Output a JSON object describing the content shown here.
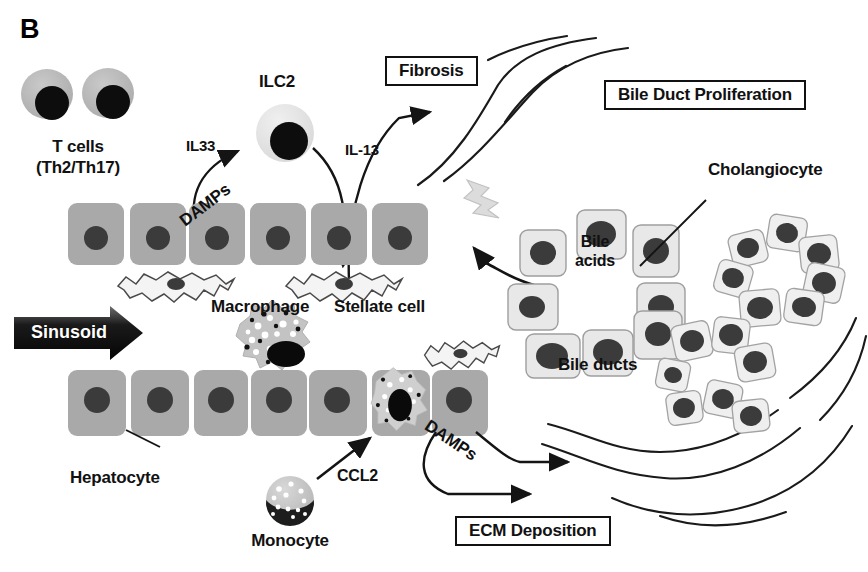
{
  "figure": {
    "panel_letter": "B",
    "background_color": "#ffffff"
  },
  "palette": {
    "hepatocyte_fill": "#a9a9a9",
    "hepatocyte_stroke": "#8c8c8c",
    "nucleus_dark": "#3b3b3b",
    "nucleus_black": "#0d0d0d",
    "tcell_fill": "#b9b9b9",
    "ilc2_fill": "#e2e2e2",
    "cholangiocyte_fill": "#e8e8e8",
    "cholangiocyte_stroke": "#9a9a9a",
    "stellate_fill": "#f2f2f2",
    "stellate_stroke": "#5a5a5a",
    "macrophage_fill": "#c3c3c3",
    "monocyte_light": "#c9c9c9",
    "lightning_fill": "#dcdcdc",
    "line_color": "#1a1a1a",
    "sinusoid_dark": "#1c1c1c",
    "text_color": "#111111"
  },
  "labels": {
    "t_cells_line1": "T cells",
    "t_cells_line2": "(Th2/Th17)",
    "ilc2": "ILC2",
    "il33": "IL33",
    "il13": "IL-13",
    "damps_upper": "DAMPs",
    "damps_lower": "DAMPs",
    "macrophage": "Macrophage",
    "stellate_cell": "Stellate cell",
    "hepatocyte": "Hepatocyte",
    "monocyte": "Monocyte",
    "ccl2": "CCL2",
    "sinusoid": "Sinusoid",
    "bile_acids_line1": "Bile",
    "bile_acids_line2": "acids",
    "bile_ducts": "Bile ducts",
    "cholangiocyte": "Cholangiocyte"
  },
  "boxes": {
    "fibrosis": "Fibrosis",
    "bile_duct_proliferation": "Bile Duct Proliferation",
    "ecm_deposition": "ECM Deposition"
  },
  "cells": {
    "t_cells": [
      {
        "cx": 47,
        "cy": 94,
        "rx": 26,
        "ry": 25,
        "nx": 52,
        "ny": 103,
        "nr": 17
      },
      {
        "cx": 108,
        "cy": 93,
        "rx": 26,
        "ry": 25,
        "nx": 113,
        "ny": 102,
        "nr": 17
      }
    ],
    "ilc2": {
      "cx": 285,
      "cy": 133,
      "rx": 29,
      "ry": 29,
      "nx": 289,
      "ny": 141,
      "nr": 19
    },
    "monocyte": {
      "cx": 290,
      "cy": 500,
      "r": 24
    },
    "hepatocytes_top_row": [
      {
        "x": 68,
        "y": 203,
        "w": 56,
        "h": 62
      },
      {
        "x": 130,
        "y": 203,
        "w": 56,
        "h": 62
      },
      {
        "x": 189,
        "y": 203,
        "w": 56,
        "h": 62
      },
      {
        "x": 250,
        "y": 203,
        "w": 56,
        "h": 62
      },
      {
        "x": 311,
        "y": 203,
        "w": 56,
        "h": 62
      },
      {
        "x": 372,
        "y": 203,
        "w": 56,
        "h": 62
      }
    ],
    "hepatocytes_bottom_row": [
      {
        "x": 68,
        "y": 370,
        "w": 58,
        "h": 66
      },
      {
        "x": 131,
        "y": 370,
        "w": 58,
        "h": 66
      },
      {
        "x": 194,
        "y": 370,
        "w": 58,
        "h": 66
      },
      {
        "x": 251,
        "y": 370,
        "w": 58,
        "h": 66
      },
      {
        "x": 307,
        "y": 370,
        "w": 58,
        "h": 66
      },
      {
        "x": 372,
        "y": 370,
        "w": 58,
        "h": 66
      },
      {
        "x": 430,
        "y": 370,
        "w": 58,
        "h": 66
      }
    ],
    "stellate_cells": [
      {
        "cx": 176,
        "cy": 281,
        "s": 1.0
      },
      {
        "cx": 344,
        "cy": 281,
        "s": 1.0
      },
      {
        "cx": 458,
        "cy": 350,
        "s": 0.9
      }
    ],
    "macrophages": [
      {
        "cx": 274,
        "cy": 338,
        "r": 35
      },
      {
        "cx": 398,
        "cy": 398,
        "r": 28
      }
    ],
    "cholangiocytes_ring_left": [
      {
        "x": 520,
        "y": 230,
        "w": 46,
        "h": 46,
        "rot": 0
      },
      {
        "x": 577,
        "y": 210,
        "w": 49,
        "h": 49,
        "rot": 0
      },
      {
        "x": 633,
        "y": 225,
        "w": 46,
        "h": 50,
        "rot": 0
      },
      {
        "x": 509,
        "y": 285,
        "w": 48,
        "h": 44,
        "rot": 0
      },
      {
        "x": 648,
        "y": 285,
        "w": 50,
        "h": 46,
        "rot": 0
      },
      {
        "x": 530,
        "y": 330,
        "w": 52,
        "h": 44,
        "rot": 0
      },
      {
        "x": 585,
        "y": 323,
        "w": 48,
        "h": 46,
        "rot": 0
      },
      {
        "x": 638,
        "y": 303,
        "w": 46,
        "h": 46,
        "rot": 0
      }
    ],
    "cholangiocytes_cluster_upper": [
      {
        "x": 730,
        "y": 232,
        "w": 36,
        "h": 33,
        "rot": -12
      },
      {
        "x": 768,
        "y": 216,
        "w": 38,
        "h": 34,
        "rot": 10
      },
      {
        "x": 800,
        "y": 236,
        "w": 38,
        "h": 36,
        "rot": -8
      },
      {
        "x": 716,
        "y": 262,
        "w": 35,
        "h": 33,
        "rot": 14
      },
      {
        "x": 805,
        "y": 265,
        "w": 38,
        "h": 36,
        "rot": 12
      },
      {
        "x": 740,
        "y": 290,
        "w": 40,
        "h": 36,
        "rot": -6
      },
      {
        "x": 785,
        "y": 290,
        "w": 38,
        "h": 34,
        "rot": 8
      }
    ],
    "cholangiocytes_cluster_lower": [
      {
        "x": 673,
        "y": 323,
        "w": 38,
        "h": 36,
        "rot": -12
      },
      {
        "x": 713,
        "y": 318,
        "w": 36,
        "h": 35,
        "rot": 8
      },
      {
        "x": 657,
        "y": 360,
        "w": 32,
        "h": 30,
        "rot": 10
      },
      {
        "x": 736,
        "y": 345,
        "w": 38,
        "h": 35,
        "rot": -10
      },
      {
        "x": 667,
        "y": 392,
        "w": 35,
        "h": 32,
        "rot": -8
      },
      {
        "x": 705,
        "y": 382,
        "w": 36,
        "h": 34,
        "rot": 12
      },
      {
        "x": 733,
        "y": 400,
        "w": 36,
        "h": 32,
        "rot": -6
      }
    ]
  },
  "annotations": {
    "leader_lines": [
      {
        "name": "hepatocyte-leader",
        "x1": 160,
        "y1": 447,
        "x2": 125,
        "y2": 433
      },
      {
        "name": "cholangiocyte-leader",
        "x1": 706,
        "y1": 196,
        "x2": 640,
        "y2": 265
      },
      {
        "name": "bile-acid-leader",
        "x1": 486,
        "y1": 290,
        "x2": 534,
        "y2": 285
      }
    ]
  }
}
